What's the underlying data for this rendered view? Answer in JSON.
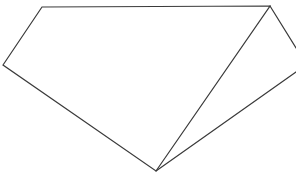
{
  "figure": {
    "type": "line-drawing",
    "canvas": {
      "width": 296,
      "height": 174,
      "background_color": "#ffffff"
    },
    "style": {
      "stroke_color": "#3a3a3a",
      "stroke_width": 1.2,
      "fill_color": "#ffffff"
    },
    "vertices": [
      {
        "name": "top-left-vertex",
        "x": 42,
        "y": 7
      },
      {
        "name": "top-right-vertex",
        "x": 270,
        "y": 6
      },
      {
        "name": "bottom-vertex",
        "x": 156,
        "y": 171
      },
      {
        "name": "left-vertex",
        "x": 3,
        "y": 65
      },
      {
        "name": "right-edge-upper-point",
        "x": 296,
        "y": 48
      },
      {
        "name": "right-edge-lower-point",
        "x": 296,
        "y": 72
      }
    ],
    "paths": {
      "main_outline": "M 42,7 L 270,6 L 156,171 L 3,65 Z",
      "right_wedge_upper": "M 270,6 L 296,48",
      "right_wedge_lower": "M 156,171 L 296,72",
      "main_outline_fill": "M 42,7 L 270,6 L 156,171 L 3,65 Z"
    },
    "edges": [
      {
        "name": "top-edge",
        "from": "top-left-vertex",
        "to": "top-right-vertex"
      },
      {
        "name": "right-upper-edge",
        "from": "top-right-vertex",
        "to": "bottom-vertex"
      },
      {
        "name": "bottom-left-edge",
        "from": "bottom-vertex",
        "to": "left-vertex"
      },
      {
        "name": "upper-left-edge",
        "from": "left-vertex",
        "to": "top-left-vertex"
      },
      {
        "name": "wedge-upper-edge",
        "from": "top-right-vertex",
        "to": "right-edge-upper-point"
      },
      {
        "name": "wedge-lower-edge",
        "from": "bottom-vertex",
        "to": "right-edge-lower-point"
      }
    ]
  }
}
